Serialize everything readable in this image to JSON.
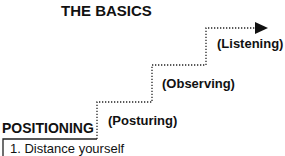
{
  "title": "THE BASICS",
  "base_label": "POSITIONING",
  "steps": [
    {
      "label": "(Posturing)"
    },
    {
      "label": "(Observing)"
    },
    {
      "label": "(Listening)"
    }
  ],
  "list": {
    "items": [
      "1. Distance yourself"
    ]
  },
  "arrow": {
    "direction": "right",
    "style": "dotted"
  },
  "colors": {
    "line": "#222222",
    "text": "#111111",
    "background": "#ffffff"
  }
}
